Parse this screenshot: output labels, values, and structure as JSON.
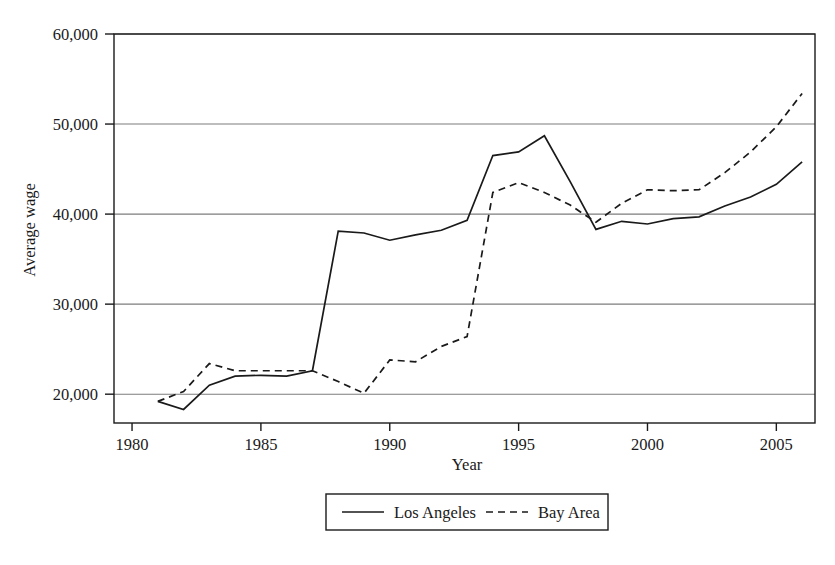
{
  "chart_data": {
    "type": "line",
    "title": "",
    "xlabel": "Year",
    "ylabel": "Average wage",
    "xlim": [
      1979.3,
      2006.5
    ],
    "ylim": [
      16800,
      60000
    ],
    "grid": true,
    "grid_axis": "y",
    "legend_position": "bottom-center",
    "x_ticks": [
      1980,
      1985,
      1990,
      1995,
      2000,
      2005
    ],
    "x_tick_labels": [
      "1980",
      "1985",
      "1990",
      "1995",
      "2000",
      "2005"
    ],
    "y_ticks": [
      20000,
      30000,
      40000,
      50000,
      60000
    ],
    "y_tick_labels": [
      "20,000",
      "30,000",
      "40,000",
      "50,000",
      "60,000"
    ],
    "x": [
      1981,
      1982,
      1983,
      1984,
      1985,
      1986,
      1987,
      1988,
      1989,
      1990,
      1991,
      1992,
      1993,
      1994,
      1995,
      1996,
      1997,
      1998,
      1999,
      2000,
      2001,
      2002,
      2003,
      2004,
      2005,
      2006
    ],
    "series": [
      {
        "name": "Los Angeles",
        "style": "solid",
        "color": "#1a1a1a",
        "values": [
          19200,
          18300,
          21000,
          22000,
          22100,
          22000,
          22600,
          38100,
          37900,
          37100,
          37700,
          38200,
          39300,
          46500,
          46900,
          48700,
          43600,
          38300,
          39200,
          38900,
          39500,
          39700,
          40900,
          41900,
          43300,
          45800
        ]
      },
      {
        "name": "Bay Area",
        "style": "dashed",
        "color": "#1a1a1a",
        "values": [
          19200,
          20300,
          23400,
          22600,
          22600,
          22600,
          22600,
          21400,
          20100,
          23800,
          23600,
          25300,
          26400,
          42400,
          43500,
          42400,
          41000,
          39100,
          41200,
          42700,
          42600,
          42700,
          44600,
          46900,
          49700,
          53400
        ]
      }
    ]
  },
  "legend": {
    "entries": [
      {
        "label": "Los Angeles",
        "style": "solid"
      },
      {
        "label": "Bay Area",
        "style": "dashed"
      }
    ]
  },
  "axes": {
    "x_title": "Year",
    "y_title": "Average wage"
  }
}
